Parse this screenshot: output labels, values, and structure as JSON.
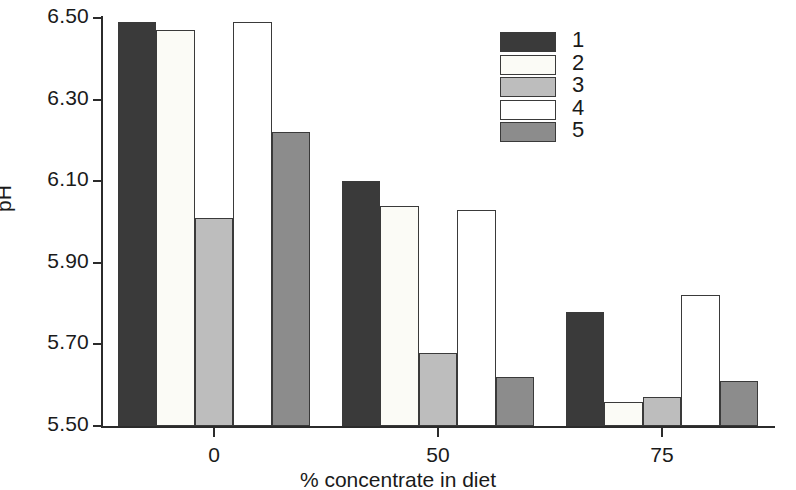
{
  "chart_data": {
    "type": "bar",
    "title": "",
    "xlabel": "% concentrate in diet",
    "ylabel": "pH",
    "categories": [
      "0",
      "50",
      "75"
    ],
    "ylim": [
      5.5,
      6.5
    ],
    "yticks": [
      "5.50",
      "5.70",
      "5.90",
      "6.10",
      "6.30",
      "6.50"
    ],
    "ytick_values": [
      5.5,
      5.7,
      5.9,
      6.1,
      6.3,
      6.5
    ],
    "grid": false,
    "legend_position": "top-right",
    "series": [
      {
        "name": "1",
        "color": "#3a3a3a",
        "values": [
          6.49,
          6.1,
          5.78
        ]
      },
      {
        "name": "2",
        "color": "#fbfbf6",
        "values": [
          6.47,
          6.04,
          5.56
        ]
      },
      {
        "name": "3",
        "color": "#bdbdbd",
        "values": [
          6.01,
          5.68,
          5.57
        ]
      },
      {
        "name": "4",
        "color": "#ffffff",
        "values": [
          6.49,
          6.03,
          5.82
        ]
      },
      {
        "name": "5",
        "color": "#8c8c8c",
        "values": [
          6.22,
          5.62,
          5.61
        ]
      }
    ]
  }
}
